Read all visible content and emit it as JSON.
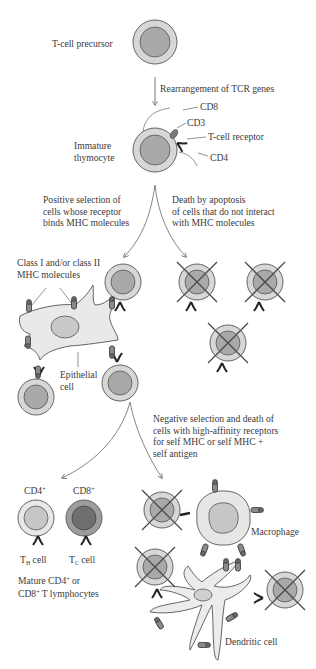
{
  "diagram": {
    "stages": {
      "precursor": {
        "label": "T-cell precursor"
      },
      "rearrangement": {
        "label": "Rearrangement of TCR genes"
      },
      "immature": {
        "label_line1": "Immature",
        "label_line2": "thymocyte"
      },
      "markers": {
        "cd8": "CD8",
        "cd3": "CD3",
        "tcr": "T-cell receptor",
        "cd4": "CD4"
      },
      "positive_selection": {
        "line1": "Positive selection of",
        "line2": "cells whose receptor",
        "line3": "binds MHC molecules"
      },
      "apoptosis": {
        "line1": "Death by apoptosis",
        "line2": "of cells that do not interact",
        "line3": "with MHC molecules"
      },
      "mhc_label": {
        "line1": "Class I and/or class II",
        "line2": "MHC molecules"
      },
      "epithelial": {
        "line1": "Epithelial",
        "line2": "cell"
      },
      "negative_selection": {
        "line1": "Negative selection and death of",
        "line2": "cells with high-affinity receptors",
        "line3": "for self MHC or self MHC +",
        "line4": "self antigen"
      },
      "mature": {
        "cd4_label": "CD4",
        "cd8_label": "CD8",
        "plus": "+",
        "th_prefix": "T",
        "th_sub": "H",
        "th_suffix": " cell",
        "tc_prefix": "T",
        "tc_sub": "C",
        "tc_suffix": " cell",
        "summary_line1_a": "Mature CD4",
        "summary_line1_b": " or",
        "summary_line2_a": "CD8",
        "summary_line2_b": " T lymphocytes"
      },
      "macrophage": {
        "label": "Macrophage"
      },
      "dendritic": {
        "label": "Dendritic cell"
      }
    },
    "colors": {
      "outer_cell": "#d7d7d7",
      "nucleus": "#a9a9a9",
      "stroke": "#555555",
      "epithelial_fill": "#e9e9e9",
      "cd8_cell_outer": "#9d9d9d",
      "cd8_cell_nucleus": "#6f6f6f",
      "cross": "#4a4a4a"
    }
  }
}
